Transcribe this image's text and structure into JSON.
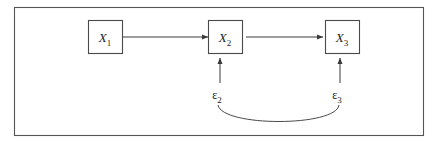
{
  "figure": {
    "kind": "path-diagram",
    "background_color": "#ffffff",
    "frame_color": "#555555",
    "line_color": "#3a3a3a",
    "text_color": "#1c1c1c",
    "width": 438,
    "height": 143
  },
  "nodes": [
    {
      "id": "x1",
      "base": "X",
      "subscript": "1",
      "label": "X1"
    },
    {
      "id": "x2",
      "base": "X",
      "subscript": "2",
      "label": "X2"
    },
    {
      "id": "x3",
      "base": "X",
      "subscript": "3",
      "label": "X3"
    }
  ],
  "errors": [
    {
      "id": "e2",
      "base": "ε",
      "subscript": "2",
      "label": "ε2"
    },
    {
      "id": "e3",
      "base": "ε",
      "subscript": "3",
      "label": "ε3"
    }
  ],
  "edges": [
    {
      "id": "x1-to-x2",
      "from": "x1",
      "to": "x2",
      "style": "single-headed-arrow",
      "orientation": "horizontal"
    },
    {
      "id": "x2-to-x3",
      "from": "x2",
      "to": "x3",
      "style": "single-headed-arrow",
      "orientation": "horizontal"
    },
    {
      "id": "e2-to-x2",
      "from": "e2",
      "to": "x2",
      "style": "single-headed-arrow",
      "orientation": "vertical"
    },
    {
      "id": "e3-to-x3",
      "from": "e3",
      "to": "x3",
      "style": "single-headed-arrow",
      "orientation": "vertical"
    },
    {
      "id": "e2-corr-e3",
      "from": "e2",
      "to": "e3",
      "style": "curved-line",
      "orientation": "arc"
    }
  ]
}
